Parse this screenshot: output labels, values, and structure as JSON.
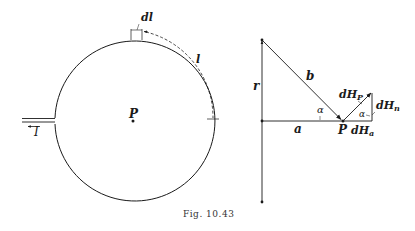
{
  "figure": {
    "caption": "Fig. 10.43",
    "colors": {
      "ink": "#1a1a1a",
      "background": "#ffffff"
    }
  },
  "left_diagram": {
    "description": "Circular current loop with point P at center",
    "labels": {
      "element": "dl",
      "arc_length": "l",
      "center_point": "P",
      "current": "I"
    }
  },
  "right_diagram": {
    "description": "Geometry of field contribution dH_P at point P",
    "labels": {
      "radius": "r",
      "hypotenuse": "b",
      "distance": "a",
      "point": "P",
      "angle_1": "α",
      "angle_2": "α",
      "dH_p_main": "dH",
      "dH_p_sub": "P",
      "dH_n_main": "dH",
      "dH_n_sub": "n",
      "dH_a_main": "dH",
      "dH_a_sub": "a"
    }
  }
}
